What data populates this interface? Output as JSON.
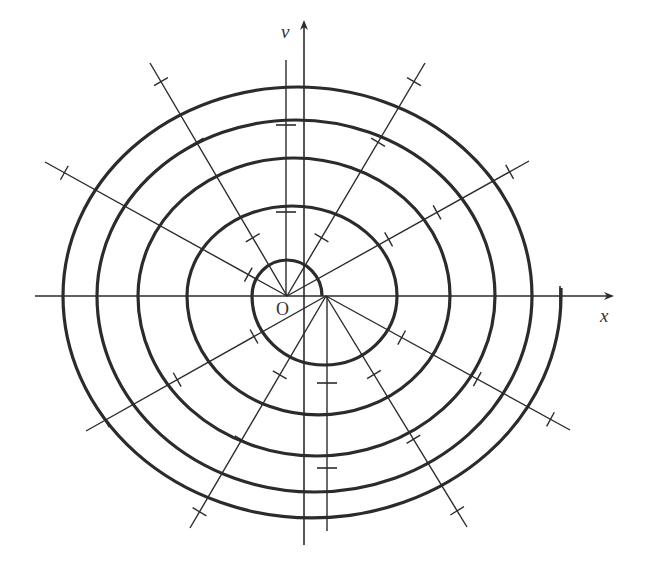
{
  "diagram": {
    "labels": {
      "x_axis": "x",
      "y_axis": "v",
      "origin": "O"
    },
    "colors": {
      "stroke": "#2b2b2b",
      "background": "#ffffff"
    },
    "centres": {
      "O": [
        287,
        296
      ],
      "O_prime": [
        326,
        296
      ]
    },
    "axes": {
      "x_axis": {
        "from": [
          35,
          296
        ],
        "to": [
          612,
          296
        ]
      },
      "y_axis": {
        "from": [
          304,
          545
        ],
        "to": [
          304,
          22
        ]
      },
      "aux_vertical_upper": {
        "from": [
          286,
          60
        ],
        "to": [
          286,
          296
        ]
      },
      "aux_vertical_lower": {
        "from": [
          327,
          296
        ],
        "to": [
          327,
          531
        ]
      }
    },
    "upper_arcs": [
      {
        "left_x": 252,
        "right_x": 322,
        "top_y": 260
      },
      {
        "left_x": 187,
        "right_x": 397,
        "top_y": 206
      },
      {
        "left_x": 138,
        "right_x": 450,
        "top_y": 158
      },
      {
        "left_x": 97,
        "right_x": 495,
        "top_y": 120
      },
      {
        "left_x": 63,
        "right_x": 532,
        "top_y": 87
      }
    ],
    "lower_arcs": [
      {
        "left_x": 252,
        "right_x": 397,
        "bottom_y": 365
      },
      {
        "left_x": 187,
        "right_x": 450,
        "bottom_y": 415
      },
      {
        "left_x": 138,
        "right_x": 495,
        "bottom_y": 456
      },
      {
        "left_x": 97,
        "right_x": 532,
        "bottom_y": 492
      },
      {
        "left_x": 63,
        "right_x": 561,
        "bottom_y": 518
      }
    ],
    "spiral_end": {
      "x": 561,
      "top_y": 288
    },
    "rays": [
      {
        "name": "ray-upper-left-shallow",
        "from": [
          287,
          296
        ],
        "to": [
          45,
          162
        ],
        "ticks": [
          0.16,
          0.67,
          0.92
        ]
      },
      {
        "name": "ray-upper-left-steep",
        "from": [
          287,
          296
        ],
        "to": [
          150,
          63
        ],
        "ticks": [
          0.25,
          0.66,
          0.92
        ]
      },
      {
        "name": "ray-upper-right-steep",
        "from": [
          287,
          296
        ],
        "to": [
          425,
          63
        ],
        "ticks": [
          0.25,
          0.66,
          0.92
        ]
      },
      {
        "name": "ray-upper-right-shallow",
        "from": [
          287,
          296
        ],
        "to": [
          529,
          161
        ],
        "ticks": [
          0.42,
          0.62,
          0.92
        ]
      },
      {
        "name": "ray-lower-left-shallow",
        "from": [
          326,
          296
        ],
        "to": [
          86,
          431
        ],
        "ticks": [
          0.3,
          0.62,
          0.92
        ]
      },
      {
        "name": "ray-lower-left-steep",
        "from": [
          326,
          296
        ],
        "to": [
          190,
          528
        ],
        "ticks": [
          0.34,
          0.62,
          0.93
        ]
      },
      {
        "name": "ray-lower-right-steep",
        "from": [
          326,
          296
        ],
        "to": [
          467,
          527
        ],
        "ticks": [
          0.34,
          0.62,
          0.93
        ]
      },
      {
        "name": "ray-lower-right-shallow",
        "from": [
          326,
          296
        ],
        "to": [
          570,
          430
        ],
        "ticks": [
          0.31,
          0.62,
          0.92
        ]
      }
    ],
    "axis_ticks": [
      {
        "x": 286,
        "y": 212,
        "orient": "h"
      },
      {
        "x": 286,
        "y": 125,
        "orient": "h"
      },
      {
        "x": 327,
        "y": 383,
        "orient": "h"
      },
      {
        "x": 327,
        "y": 468,
        "orient": "h"
      },
      {
        "x": 560,
        "y": 296,
        "orient": "v"
      }
    ]
  }
}
